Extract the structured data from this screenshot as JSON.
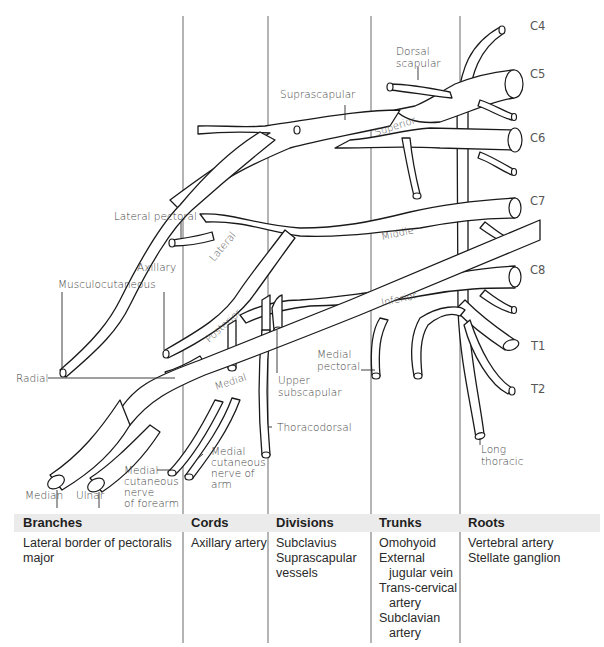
{
  "diagram": {
    "roots": [
      "C4",
      "C5",
      "C6",
      "C7",
      "C8",
      "T1",
      "T2"
    ],
    "trunks": [
      "Superior",
      "Middle",
      "Inferior"
    ],
    "cords": [
      "Lateral",
      "Posterior",
      "Medial"
    ],
    "nerve_labels": {
      "dorsal_scapular": [
        "Dorsal",
        "scapular"
      ],
      "suprascapular": "Suprascapular",
      "lateral_pectoral": "Lateral pectoral",
      "axillary": "Axillary",
      "musculocutaneous": "Musculocutaneous",
      "radial": "Radial",
      "median": "Median",
      "ulnar": "Ulnar",
      "medial_cutaneous_forearm": [
        "Medial",
        "cutaneous",
        "nerve",
        "of forearm"
      ],
      "medial_cutaneous_arm": [
        "Medial",
        "cutaneous",
        "nerve of",
        "arm"
      ],
      "thoracodorsal": "Thoracodorsal",
      "upper_subscapular": [
        "Upper",
        "subscapular"
      ],
      "medial_pectoral": [
        "Medial",
        "pectoral"
      ],
      "long_thoracic": [
        "Long",
        "thoracic"
      ]
    }
  },
  "table": {
    "columns": [
      {
        "header": "Branches",
        "items": [
          "Lateral border of pectoralis",
          "major"
        ]
      },
      {
        "header": "Cords",
        "items": [
          "Axillary artery"
        ]
      },
      {
        "header": "Divisions",
        "items": [
          "Subclavius",
          "Suprascapular",
          "vessels"
        ]
      },
      {
        "header": "Trunks",
        "items": [
          "Omohyoid",
          "External",
          "jugular vein",
          "Trans-cervical",
          "artery",
          "Subclavian",
          "artery"
        ]
      },
      {
        "header": "Roots",
        "items": [
          "Vertebral artery",
          "Stellate ganglion"
        ]
      }
    ]
  },
  "colors": {
    "line": "#1a1a1a",
    "header_band": "#ebebeb",
    "divider": "#6a6a6a"
  }
}
